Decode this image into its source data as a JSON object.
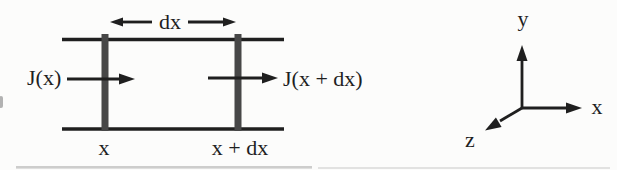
{
  "colors": {
    "ink": "#1f1f1f",
    "slab_bar": "#474747",
    "background": "#fcfcfb",
    "artifact_gray": "#9e9e9e"
  },
  "slab_diagram": {
    "width_label": "dx",
    "flux_in_label": "J(x)",
    "flux_out_label": "J(x + dx)",
    "left_face_label": "x",
    "right_face_label": "x + dx"
  },
  "coordinate_axes": {
    "y_label": "y",
    "x_label": "x",
    "z_label": "z"
  }
}
